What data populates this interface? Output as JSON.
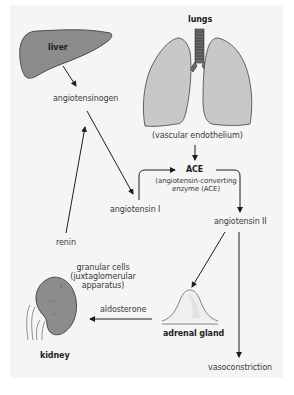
{
  "colors": {
    "background": "#ffffff",
    "panel": "#f5f5f5",
    "organ_fill": "#8c8c8c",
    "lung_fill": "#c8c8c8",
    "organ_stroke": "#4a4a4a",
    "arrow": "#1e1e1e",
    "text": "#3a3a3a"
  },
  "organs": {
    "liver": "liver",
    "lungs": "lungs",
    "kidney": "kidney",
    "adrenal_gland": "adrenal gland"
  },
  "nodes": {
    "angiotensinogen": "angiotensinogen",
    "vascular_endothelium": "(vascular endothelium)",
    "ace": "ACE",
    "ace_full_line1": "(angiotensin-converting",
    "ace_full_line2": "enzyme (ACE)",
    "angiotensin_i": "angiotensin I",
    "angiotensin_ii": "angiotensin II",
    "renin": "renin",
    "granular_cells_line1": "granular cells",
    "granular_cells_line2": "(juxtaglomerular",
    "granular_cells_line3": "apparatus)",
    "aldosterone": "aldosterone",
    "vasoconstriction": "vasoconstriction"
  },
  "edges": [
    {
      "from": "liver",
      "to": "angiotensinogen"
    },
    {
      "from": "angiotensinogen",
      "to": "angiotensin I"
    },
    {
      "from": "renin",
      "to": "angiotensinogen-to-angiotensin I conversion"
    },
    {
      "from": "vascular endothelium",
      "to": "ACE"
    },
    {
      "from": "angiotensin I",
      "to": "ACE"
    },
    {
      "from": "ACE",
      "to": "angiotensin II"
    },
    {
      "from": "angiotensin II",
      "to": "adrenal gland"
    },
    {
      "from": "angiotensin II",
      "to": "vasoconstriction"
    },
    {
      "from": "adrenal gland",
      "to": "kidney",
      "label": "aldosterone"
    }
  ]
}
